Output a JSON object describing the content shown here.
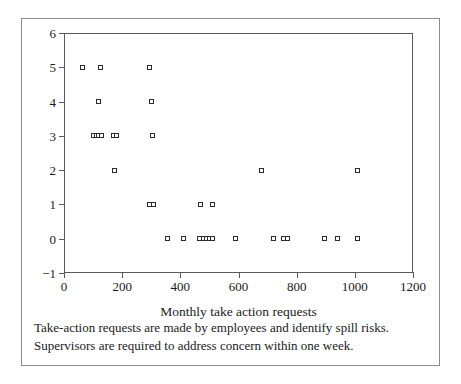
{
  "chart_data": {
    "type": "scatter",
    "title": "",
    "xlabel": "Monthly take action requests",
    "ylabel": "Spills per month",
    "xlim": [
      0,
      1200
    ],
    "ylim": [
      -1,
      6
    ],
    "xticks": [
      0,
      200,
      400,
      600,
      800,
      1000,
      1200
    ],
    "yticks": [
      -1,
      0,
      1,
      2,
      3,
      4,
      5,
      6
    ],
    "xtick_labels": [
      "0",
      "200",
      "400",
      "600",
      "800",
      "1000",
      "1200"
    ],
    "ytick_labels": [
      "−1",
      "0",
      "1",
      "2",
      "3",
      "4",
      "5",
      "6"
    ],
    "grid": false,
    "legend": null,
    "marker": "open-square",
    "points": [
      {
        "x": 65,
        "y": 5
      },
      {
        "x": 125,
        "y": 5
      },
      {
        "x": 295,
        "y": 5
      },
      {
        "x": 120,
        "y": 4
      },
      {
        "x": 300,
        "y": 4
      },
      {
        "x": 100,
        "y": 3
      },
      {
        "x": 112,
        "y": 3
      },
      {
        "x": 120,
        "y": 3
      },
      {
        "x": 128,
        "y": 3
      },
      {
        "x": 170,
        "y": 3
      },
      {
        "x": 180,
        "y": 3
      },
      {
        "x": 305,
        "y": 3
      },
      {
        "x": 175,
        "y": 2
      },
      {
        "x": 680,
        "y": 2
      },
      {
        "x": 1010,
        "y": 2
      },
      {
        "x": 295,
        "y": 1
      },
      {
        "x": 308,
        "y": 1
      },
      {
        "x": 470,
        "y": 1
      },
      {
        "x": 510,
        "y": 1
      },
      {
        "x": 355,
        "y": 0
      },
      {
        "x": 410,
        "y": 0
      },
      {
        "x": 465,
        "y": 0
      },
      {
        "x": 478,
        "y": 0
      },
      {
        "x": 490,
        "y": 0
      },
      {
        "x": 500,
        "y": 0
      },
      {
        "x": 512,
        "y": 0
      },
      {
        "x": 590,
        "y": 0
      },
      {
        "x": 720,
        "y": 0
      },
      {
        "x": 755,
        "y": 0
      },
      {
        "x": 768,
        "y": 0
      },
      {
        "x": 895,
        "y": 0
      },
      {
        "x": 940,
        "y": 0
      },
      {
        "x": 1010,
        "y": 0
      }
    ]
  },
  "caption": {
    "line1": "Take-action requests are made by employees and identify spill risks.",
    "line2": "Supervisors are required to address concern within one week."
  }
}
